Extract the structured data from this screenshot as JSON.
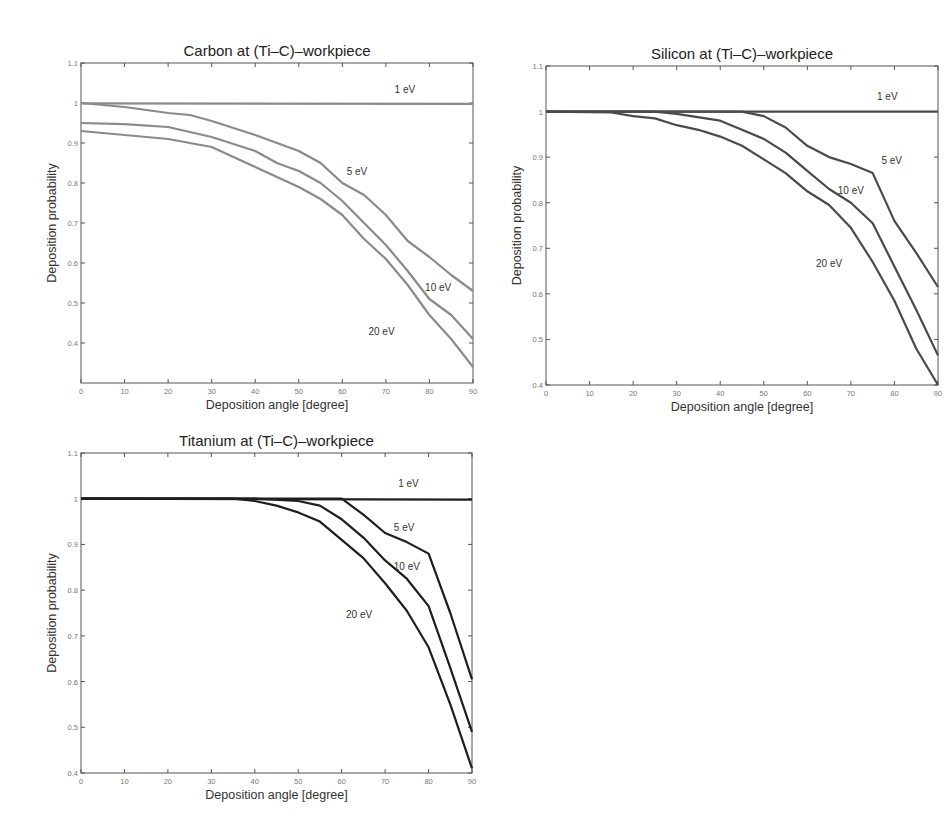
{
  "chart_data": [
    {
      "type": "line",
      "title": "Carbon at (Ti–C)–workpiece",
      "xlabel": "Deposition angle [degree]",
      "ylabel": "Deposition probability",
      "xlim": [
        0,
        90
      ],
      "ylim": [
        0.3,
        1.1
      ],
      "xticks": [
        0,
        10,
        20,
        30,
        40,
        50,
        60,
        70,
        80,
        90
      ],
      "yticks": [
        0.4,
        0.5,
        0.6,
        0.7,
        0.8,
        0.9,
        1,
        1.1
      ],
      "grid": false,
      "line_color": "#8a8a8a",
      "series": [
        {
          "name": "1 eV",
          "x": [
            0,
            90
          ],
          "values": [
            0.999,
            0.998
          ],
          "label_pos": [
            72,
            1.025
          ]
        },
        {
          "name": "5 eV",
          "x": [
            0,
            10,
            20,
            25,
            30,
            40,
            50,
            55,
            60,
            65,
            70,
            75,
            80,
            85,
            90
          ],
          "values": [
            1.0,
            0.99,
            0.975,
            0.97,
            0.955,
            0.92,
            0.88,
            0.85,
            0.8,
            0.77,
            0.72,
            0.655,
            0.615,
            0.57,
            0.53
          ],
          "label_pos": [
            61,
            0.82
          ]
        },
        {
          "name": "10 eV",
          "x": [
            0,
            10,
            20,
            30,
            40,
            45,
            50,
            55,
            60,
            65,
            70,
            75,
            80,
            85,
            90
          ],
          "values": [
            0.95,
            0.947,
            0.94,
            0.915,
            0.88,
            0.85,
            0.83,
            0.8,
            0.755,
            0.7,
            0.645,
            0.58,
            0.51,
            0.47,
            0.41
          ],
          "label_pos": [
            79,
            0.53
          ]
        },
        {
          "name": "20 eV",
          "x": [
            0,
            10,
            20,
            30,
            40,
            50,
            55,
            60,
            65,
            70,
            75,
            80,
            85,
            90
          ],
          "values": [
            0.93,
            0.92,
            0.91,
            0.89,
            0.84,
            0.79,
            0.76,
            0.72,
            0.66,
            0.61,
            0.545,
            0.47,
            0.41,
            0.34
          ],
          "label_pos": [
            66,
            0.42
          ]
        }
      ]
    },
    {
      "type": "line",
      "title": "Silicon at (Ti–C)–workpiece",
      "xlabel": "Deposition angle [degree]",
      "ylabel": "Deposition probability",
      "xlim": [
        0,
        90
      ],
      "ylim": [
        0.4,
        1.1
      ],
      "xticks": [
        0,
        10,
        20,
        30,
        40,
        50,
        60,
        70,
        80,
        90
      ],
      "yticks": [
        0.4,
        0.5,
        0.6,
        0.7,
        0.8,
        0.9,
        1,
        1.1
      ],
      "grid": false,
      "line_color": "#4a4a4a",
      "series": [
        {
          "name": "1 eV",
          "x": [
            0,
            90
          ],
          "values": [
            1.0,
            1.0
          ],
          "label_pos": [
            76,
            1.025
          ]
        },
        {
          "name": "5 eV",
          "x": [
            0,
            45,
            50,
            55,
            60,
            65,
            70,
            75,
            80,
            85,
            90
          ],
          "values": [
            1.0,
            1.0,
            0.99,
            0.965,
            0.925,
            0.9,
            0.885,
            0.865,
            0.76,
            0.69,
            0.615
          ],
          "label_pos": [
            77,
            0.885
          ]
        },
        {
          "name": "10 eV",
          "x": [
            0,
            25,
            30,
            40,
            45,
            50,
            55,
            60,
            65,
            70,
            75,
            80,
            85,
            90
          ],
          "values": [
            1.0,
            1.0,
            0.995,
            0.98,
            0.96,
            0.94,
            0.91,
            0.87,
            0.83,
            0.8,
            0.755,
            0.66,
            0.565,
            0.465
          ],
          "label_pos": [
            67,
            0.82
          ]
        },
        {
          "name": "20 eV",
          "x": [
            0,
            15,
            20,
            25,
            30,
            35,
            40,
            45,
            50,
            55,
            60,
            65,
            70,
            75,
            80,
            85,
            90
          ],
          "values": [
            1.0,
            0.998,
            0.99,
            0.985,
            0.97,
            0.96,
            0.945,
            0.925,
            0.895,
            0.865,
            0.825,
            0.795,
            0.745,
            0.67,
            0.585,
            0.48,
            0.4
          ],
          "label_pos": [
            62,
            0.66
          ]
        }
      ]
    },
    {
      "type": "line",
      "title": "Titanium at (Ti–C)–workpiece",
      "xlabel": "Deposition angle [degree]",
      "ylabel": "Deposition probability",
      "xlim": [
        0,
        90
      ],
      "ylim": [
        0.4,
        1.1
      ],
      "xticks": [
        0,
        10,
        20,
        30,
        40,
        50,
        60,
        70,
        80,
        90
      ],
      "yticks": [
        0.4,
        0.5,
        0.6,
        0.7,
        0.8,
        0.9,
        1,
        1.1
      ],
      "grid": false,
      "line_color": "#1e1e1e",
      "series": [
        {
          "name": "1 eV",
          "x": [
            0,
            90
          ],
          "values": [
            1.0,
            0.998
          ],
          "label_pos": [
            73,
            1.025
          ]
        },
        {
          "name": "5 eV",
          "x": [
            0,
            60,
            65,
            70,
            75,
            80,
            85,
            90
          ],
          "values": [
            1.0,
            1.0,
            0.965,
            0.925,
            0.905,
            0.88,
            0.75,
            0.605
          ],
          "label_pos": [
            72,
            0.93
          ]
        },
        {
          "name": "10 eV",
          "x": [
            0,
            40,
            50,
            55,
            60,
            65,
            70,
            75,
            80,
            85,
            90
          ],
          "values": [
            1.0,
            1.0,
            0.995,
            0.985,
            0.955,
            0.915,
            0.865,
            0.825,
            0.765,
            0.63,
            0.49
          ],
          "label_pos": [
            72,
            0.845
          ]
        },
        {
          "name": "20 eV",
          "x": [
            0,
            35,
            40,
            45,
            50,
            55,
            60,
            65,
            70,
            75,
            80,
            85,
            90
          ],
          "values": [
            1.0,
            1.0,
            0.995,
            0.985,
            0.97,
            0.95,
            0.91,
            0.87,
            0.815,
            0.755,
            0.675,
            0.55,
            0.41
          ],
          "label_pos": [
            61,
            0.74
          ]
        }
      ]
    }
  ],
  "layout": {
    "panels": [
      {
        "left": 81,
        "top": 63,
        "width": 392,
        "height": 320
      },
      {
        "left": 546,
        "top": 66,
        "width": 392,
        "height": 319
      },
      {
        "left": 81,
        "top": 453,
        "width": 391,
        "height": 320
      }
    ]
  }
}
